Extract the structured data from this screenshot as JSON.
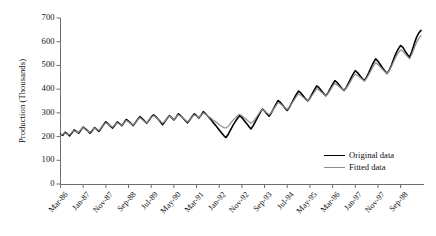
{
  "chart_data": {
    "type": "line",
    "title": "",
    "xlabel": "",
    "ylabel": "Production (Thousands)",
    "ylim": [
      0,
      700
    ],
    "yticks": [
      0,
      100,
      200,
      300,
      400,
      500,
      600,
      700
    ],
    "grid": false,
    "legend_position": "inside-bottom-right",
    "x_tick_labels": [
      "Mar-86",
      "Jan-87",
      "Nov-87",
      "Sep-88",
      "Jul-89",
      "May-90",
      "Mar-91",
      "Jan-92",
      "Nov-92",
      "Sep-93",
      "Jul-94",
      "May-95",
      "Mar-96",
      "Jan-97",
      "Nov-97",
      "Sep-98"
    ],
    "x_tick_interval_months": 10,
    "x_start": "Mar-86",
    "x_end": "Sep-98",
    "n_points": 151,
    "series": [
      {
        "name": "Original data",
        "color": "#000000",
        "width": 1.6,
        "values": [
          210,
          205,
          218,
          212,
          203,
          215,
          228,
          222,
          214,
          228,
          240,
          232,
          224,
          214,
          225,
          238,
          230,
          222,
          236,
          250,
          262,
          254,
          244,
          236,
          248,
          262,
          255,
          246,
          258,
          272,
          265,
          256,
          246,
          258,
          272,
          284,
          276,
          266,
          256,
          268,
          282,
          292,
          284,
          274,
          263,
          250,
          262,
          276,
          288,
          280,
          270,
          282,
          296,
          288,
          278,
          268,
          258,
          270,
          284,
          296,
          288,
          278,
          290,
          305,
          296,
          286,
          276,
          264,
          252,
          240,
          228,
          216,
          204,
          196,
          210,
          228,
          246,
          262,
          276,
          288,
          280,
          268,
          256,
          244,
          232,
          246,
          264,
          282,
          300,
          316,
          308,
          296,
          286,
          300,
          318,
          336,
          352,
          344,
          332,
          320,
          310,
          324,
          342,
          360,
          378,
          392,
          384,
          372,
          360,
          350,
          362,
          380,
          398,
          414,
          406,
          394,
          382,
          372,
          384,
          402,
          420,
          436,
          428,
          416,
          404,
          394,
          406,
          424,
          444,
          462,
          478,
          470,
          458,
          446,
          436,
          450,
          470,
          492,
          512,
          528,
          518,
          504,
          490,
          478,
          466,
          480,
          502,
          528,
          552,
          570,
          584,
          576,
          560,
          546,
          534,
          560,
          590,
          618,
          636,
          648
        ]
      },
      {
        "name": "Fitted data",
        "color": "#8c8c8c",
        "width": 1.2,
        "values": [
          206,
          210,
          216,
          210,
          208,
          218,
          224,
          220,
          218,
          230,
          238,
          230,
          222,
          218,
          228,
          236,
          232,
          226,
          238,
          248,
          258,
          252,
          246,
          240,
          250,
          258,
          252,
          248,
          258,
          268,
          262,
          254,
          248,
          258,
          270,
          280,
          272,
          264,
          258,
          268,
          280,
          288,
          282,
          274,
          266,
          256,
          264,
          276,
          286,
          280,
          272,
          282,
          292,
          286,
          278,
          270,
          262,
          272,
          282,
          292,
          286,
          280,
          290,
          300,
          294,
          286,
          280,
          272,
          266,
          258,
          250,
          244,
          238,
          236,
          244,
          256,
          268,
          278,
          288,
          294,
          288,
          280,
          272,
          264,
          256,
          264,
          276,
          290,
          304,
          314,
          308,
          300,
          292,
          302,
          316,
          330,
          344,
          338,
          330,
          322,
          314,
          326,
          340,
          354,
          368,
          380,
          374,
          366,
          358,
          350,
          360,
          374,
          388,
          402,
          396,
          388,
          380,
          372,
          382,
          396,
          412,
          424,
          418,
          410,
          402,
          394,
          404,
          418,
          434,
          450,
          464,
          458,
          450,
          442,
          434,
          446,
          462,
          480,
          498,
          512,
          504,
          494,
          484,
          474,
          466,
          478,
          496,
          518,
          538,
          554,
          566,
          560,
          548,
          538,
          528,
          548,
          572,
          596,
          614,
          626
        ]
      }
    ]
  },
  "legend": {
    "items": [
      {
        "label": "Original data",
        "color": "#000000"
      },
      {
        "label": "Fitted data",
        "color": "#8c8c8c"
      }
    ]
  },
  "axis": {
    "y_title": "Production (Thousands)"
  }
}
